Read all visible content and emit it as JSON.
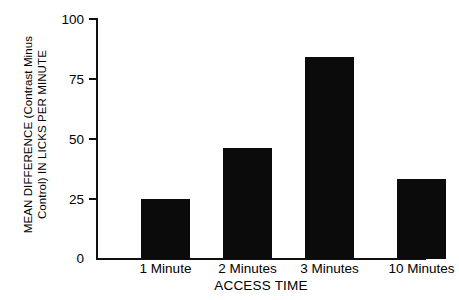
{
  "chart_data": {
    "type": "bar",
    "title": "",
    "subtitle": "",
    "categories": [
      "1 Minute",
      "2 Minutes",
      "3 Minutes",
      "10 Minutes"
    ],
    "values": [
      25,
      46,
      84,
      33
    ],
    "xlabel": "ACCESS TIME",
    "ylabel_line1": "MEAN DIFFERENCE (Contrast Minus",
    "ylabel_line2": "Control) IN LICKS PER MINUTE",
    "ylabel": "MEAN DIFFERENCE (Contrast Minus Control) IN LICKS PER MINUTE",
    "ylim": [
      0,
      100
    ],
    "yticks": [
      "0",
      "25",
      "50",
      "75",
      "100"
    ],
    "ytick_values": [
      0,
      25,
      50,
      75,
      100
    ],
    "grid": false,
    "legend": "none",
    "bar_color": "#0b0b0b",
    "axis_color": "#101010",
    "background_color": "#ffffff"
  },
  "axes": {
    "y_tick_0": "0",
    "y_tick_25": "25",
    "y_tick_50": "50",
    "y_tick_75": "75",
    "y_tick_100": "100"
  },
  "bars": [
    {
      "label": "1 Minute",
      "value": 25
    },
    {
      "label": "2 Minutes",
      "value": 46
    },
    {
      "label": "3 Minutes",
      "value": 84
    },
    {
      "label": "10 Minutes",
      "value": 33
    }
  ]
}
